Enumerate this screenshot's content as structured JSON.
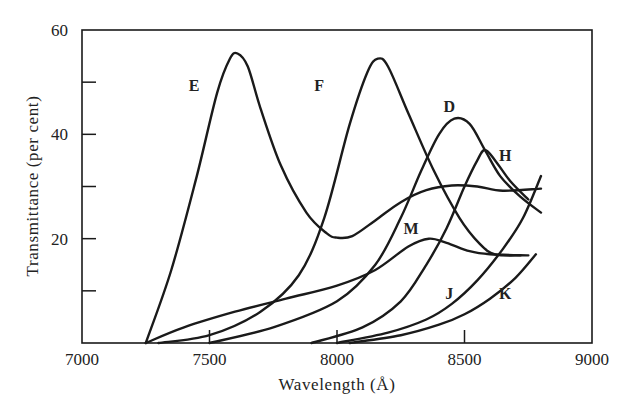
{
  "chart_data": {
    "type": "line",
    "title": "",
    "xlabel": "Wavelength (Å)",
    "ylabel": "Transmittance (per cent)",
    "xlim": [
      7000,
      9000
    ],
    "ylim": [
      0,
      60
    ],
    "grid": false,
    "legend": "none (curves labeled inline)",
    "x_ticks": [
      7000,
      7500,
      8000,
      8500,
      9000
    ],
    "x_tick_labels": [
      "7000",
      "7500",
      "8000",
      "8500",
      "9000"
    ],
    "y_ticks": [
      0,
      10,
      20,
      30,
      40,
      50,
      60
    ],
    "y_tick_labels": [
      "",
      "",
      "20",
      "",
      "40",
      "",
      "60"
    ],
    "series": [
      {
        "name": "E",
        "label_pos": [
          7440,
          49.5
        ],
        "x": [
          7250,
          7350,
          7450,
          7530,
          7580,
          7610,
          7650,
          7700,
          7780,
          7880,
          7960,
          8000,
          8060,
          8150,
          8250,
          8350,
          8450,
          8550,
          8650,
          8800
        ],
        "y": [
          0,
          14,
          32,
          48,
          54.5,
          55.5,
          53,
          45,
          34,
          25,
          21,
          20.2,
          20.5,
          23.5,
          27,
          29.3,
          30.2,
          30,
          29.2,
          29.6
        ]
      },
      {
        "name": "F",
        "label_pos": [
          7930,
          49.5
        ],
        "x": [
          7300,
          7500,
          7700,
          7850,
          7950,
          8050,
          8120,
          8160,
          8200,
          8280,
          8380,
          8480,
          8560,
          8620,
          8720
        ],
        "y": [
          0,
          1.5,
          6,
          13,
          24,
          42,
          52,
          54.5,
          53,
          44,
          33,
          24,
          19,
          17,
          16.8
        ]
      },
      {
        "name": "D",
        "label_pos": [
          8440,
          45.5
        ],
        "x": [
          7500,
          7750,
          8000,
          8150,
          8250,
          8330,
          8400,
          8460,
          8520,
          8580,
          8640,
          8720,
          8800
        ],
        "y": [
          0,
          3,
          8,
          15,
          24,
          33,
          40,
          43,
          42,
          37,
          32,
          28,
          25
        ]
      },
      {
        "name": "H",
        "label_pos": [
          8660,
          36
        ],
        "x": [
          7900,
          8100,
          8250,
          8350,
          8430,
          8500,
          8550,
          8580,
          8620,
          8680,
          8750
        ],
        "y": [
          0,
          3,
          8,
          15,
          22,
          30,
          35,
          37,
          35,
          31,
          27.5
        ]
      },
      {
        "name": "M",
        "label_pos": [
          8290,
          22
        ],
        "x": [
          7250,
          7400,
          7600,
          7800,
          8000,
          8150,
          8280,
          8360,
          8430,
          8520,
          8600,
          8750
        ],
        "y": [
          0,
          3,
          6,
          8.5,
          11,
          14,
          18.5,
          20,
          19.2,
          17.6,
          17,
          16.8
        ]
      },
      {
        "name": "J",
        "label_pos": [
          8440,
          9.5
        ],
        "x": [
          8000,
          8200,
          8350,
          8450,
          8550,
          8650,
          8730,
          8800
        ],
        "y": [
          0,
          2,
          4.5,
          7.5,
          12,
          18,
          24,
          32
        ]
      },
      {
        "name": "K",
        "label_pos": [
          8660,
          9.5
        ],
        "x": [
          8050,
          8250,
          8400,
          8500,
          8600,
          8700,
          8780
        ],
        "y": [
          0,
          1.5,
          3.5,
          5.5,
          8.5,
          12.5,
          17
        ]
      }
    ]
  }
}
